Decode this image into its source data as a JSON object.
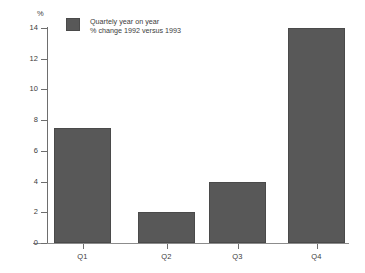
{
  "chart_data": {
    "type": "bar",
    "title": "",
    "subtitle": "",
    "categories": [
      "Q1",
      "Q2",
      "Q3",
      "Q4"
    ],
    "values": [
      7.5,
      2.0,
      4.0,
      14.0
    ],
    "series": [
      {
        "name": "Quartely year on year % change 1992 versus 1993",
        "values": [
          7.5,
          2.0,
          4.0,
          14.0
        ]
      }
    ],
    "xlabel": "",
    "ylabel": "%",
    "ylim": [
      0,
      14
    ],
    "yticks": [
      0,
      2,
      4,
      6,
      8,
      10,
      12,
      14
    ],
    "ytick_labels": [
      "0",
      "2",
      "4",
      "6",
      "8",
      "10",
      "12",
      "14"
    ],
    "grid": false,
    "legend_position": "top-left",
    "bar_color": "#585858",
    "axis_color": "#6e6e6e",
    "background_color": "#ffffff"
  },
  "axis": {
    "unit_label": "%",
    "y_ticks": [
      {
        "label": "14",
        "value": 14
      },
      {
        "label": "12",
        "value": 12
      },
      {
        "label": "10",
        "value": 10
      },
      {
        "label": "8",
        "value": 8
      },
      {
        "label": "6",
        "value": 6
      },
      {
        "label": "4",
        "value": 4
      },
      {
        "label": "2",
        "value": 2
      },
      {
        "label": "0",
        "value": 0
      }
    ],
    "x_ticks": [
      {
        "label": "Q1"
      },
      {
        "label": "Q2"
      },
      {
        "label": "Q3"
      },
      {
        "label": "Q4"
      }
    ]
  },
  "legend": {
    "items": [
      {
        "swatch_color": "#585858",
        "line1": "Quartely year on year",
        "line2": "% change 1992 versus 1993"
      }
    ]
  },
  "bars": [
    {
      "category": "Q1",
      "value": 7.5
    },
    {
      "category": "Q2",
      "value": 2.0
    },
    {
      "category": "Q3",
      "value": 4.0
    },
    {
      "category": "Q4",
      "value": 14.0
    }
  ]
}
